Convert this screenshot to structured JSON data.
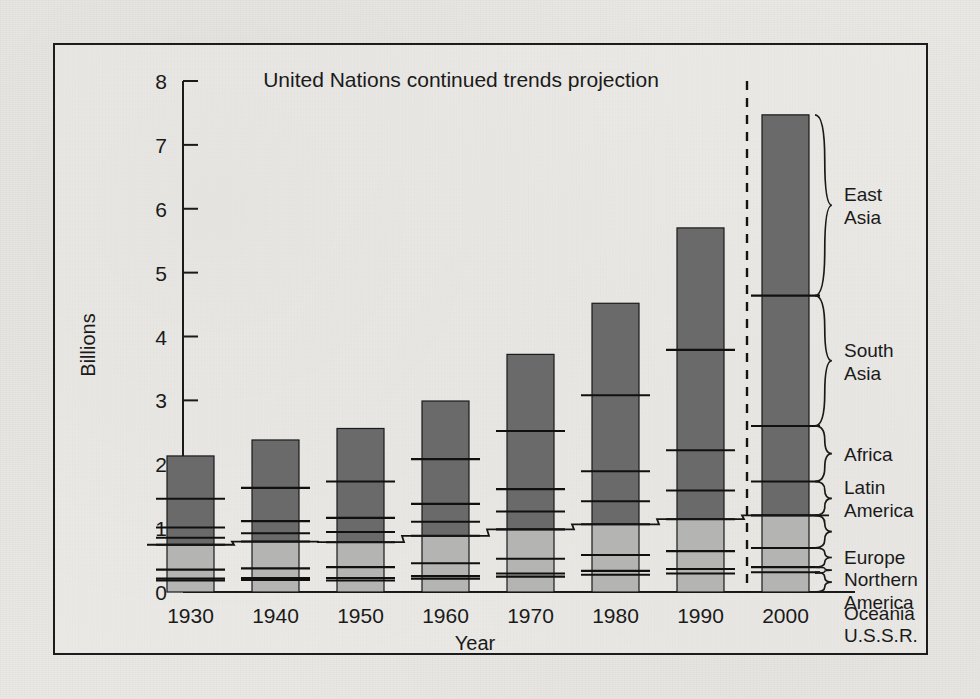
{
  "figure": {
    "title": "United Nations continued trends projection",
    "xlabel": "Year",
    "ylabel": "Billions"
  },
  "axis": {
    "y_ticks": [
      "0",
      "1",
      "2",
      "3",
      "4",
      "5",
      "6",
      "7",
      "8"
    ],
    "x_ticks": [
      "1930",
      "1940",
      "1950",
      "1960",
      "1970",
      "1980",
      "1990",
      "2000"
    ]
  },
  "region_labels": {
    "east_asia": "East\nAsia",
    "east_asia_l1": "East",
    "east_asia_l2": "Asia",
    "south_asia_l1": "South",
    "south_asia_l2": "Asia",
    "africa": "Africa",
    "latin_america_l1": "Latin",
    "latin_america_l2": "America",
    "europe": "Europe",
    "northern_america_l1": "Northern",
    "northern_america_l2": "America",
    "oceania": "Oceania",
    "ussr": "U.S.S.R."
  },
  "colors": {
    "dark_segment": "#6a6a6a",
    "light_segment": "#b4b4b2",
    "ink": "#1a1a1a",
    "paper": "#e9e8e4"
  },
  "chart_data": {
    "type": "bar",
    "stacked": true,
    "title": "United Nations continued trends projection",
    "xlabel": "Year",
    "ylabel": "Billions",
    "ylim": [
      0,
      8
    ],
    "yticks": [
      0,
      1,
      2,
      3,
      4,
      5,
      6,
      7,
      8
    ],
    "grid": false,
    "legend": "right-side braces",
    "categories": [
      "1930",
      "1940",
      "1950",
      "1960",
      "1970",
      "1980",
      "1990",
      "2000"
    ],
    "totals": [
      2.13,
      2.38,
      2.56,
      2.99,
      3.72,
      4.52,
      5.7,
      7.47
    ],
    "projection_starts_after": "1990",
    "series": [
      {
        "name": "U.S.S.R.",
        "shade": "light",
        "values": [
          0.18,
          0.19,
          0.18,
          0.21,
          0.24,
          0.27,
          0.29,
          0.31
        ]
      },
      {
        "name": "Oceania",
        "shade": "light",
        "values": [
          0.03,
          0.03,
          0.04,
          0.04,
          0.05,
          0.06,
          0.07,
          0.08
        ]
      },
      {
        "name": "Northern America",
        "shade": "light",
        "values": [
          0.14,
          0.15,
          0.17,
          0.2,
          0.23,
          0.25,
          0.28,
          0.3
        ]
      },
      {
        "name": "Europe",
        "shade": "light",
        "values": [
          0.39,
          0.42,
          0.39,
          0.43,
          0.46,
          0.48,
          0.5,
          0.51
        ]
      },
      {
        "name": "Latin America",
        "shade": "dark",
        "values": [
          0.11,
          0.13,
          0.16,
          0.22,
          0.28,
          0.36,
          0.45,
          0.53
        ]
      },
      {
        "name": "Africa",
        "shade": "dark",
        "values": [
          0.16,
          0.19,
          0.22,
          0.28,
          0.35,
          0.47,
          0.63,
          0.87
        ]
      },
      {
        "name": "South Asia",
        "shade": "dark",
        "values": [
          0.45,
          0.52,
          0.57,
          0.7,
          0.91,
          1.19,
          1.57,
          2.04
        ]
      },
      {
        "name": "East Asia",
        "shade": "dark",
        "values": [
          0.67,
          0.75,
          0.83,
          0.91,
          1.2,
          1.44,
          1.91,
          2.83
        ]
      }
    ],
    "step_line": {
      "name": "developed-regions cumulative",
      "values": [
        0.74,
        0.79,
        0.78,
        0.88,
        0.98,
        1.06,
        1.14,
        1.2
      ]
    }
  }
}
